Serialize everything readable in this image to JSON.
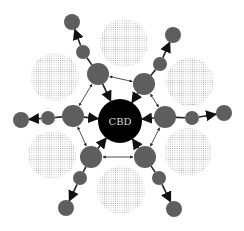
{
  "diagram": {
    "center": {
      "label": "CBD",
      "x": 120,
      "y": 121,
      "r": 22,
      "fill": "#000000",
      "text_color": "#d8d8d8"
    },
    "colors": {
      "node": "#5e5e5e",
      "edge": "#222222",
      "dots": "#b0b0b0"
    },
    "zones": [
      {
        "x": 124,
        "y": 43,
        "r": 24
      },
      {
        "x": 55,
        "y": 77,
        "r": 24
      },
      {
        "x": 190,
        "y": 82,
        "r": 24
      },
      {
        "x": 52,
        "y": 155,
        "r": 24
      },
      {
        "x": 188,
        "y": 152,
        "r": 24
      },
      {
        "x": 121,
        "y": 190,
        "r": 24
      }
    ],
    "inner_nodes": [
      {
        "id": "tl",
        "x": 98,
        "y": 74,
        "r": 11
      },
      {
        "id": "tr",
        "x": 144,
        "y": 84,
        "r": 11
      },
      {
        "id": "l",
        "x": 73,
        "y": 116,
        "r": 11
      },
      {
        "id": "r",
        "x": 165,
        "y": 117,
        "r": 11
      },
      {
        "id": "bl",
        "x": 91,
        "y": 157,
        "r": 11
      },
      {
        "id": "br",
        "x": 145,
        "y": 157,
        "r": 11
      }
    ],
    "mid_nodes": [
      {
        "id": "tl",
        "x": 83,
        "y": 52,
        "r": 7
      },
      {
        "id": "tr",
        "x": 160,
        "y": 64,
        "r": 7
      },
      {
        "id": "l",
        "x": 48,
        "y": 118,
        "r": 7
      },
      {
        "id": "r",
        "x": 192,
        "y": 118,
        "r": 7
      },
      {
        "id": "bl",
        "x": 80,
        "y": 178,
        "r": 7
      },
      {
        "id": "br",
        "x": 159,
        "y": 178,
        "r": 7
      }
    ],
    "outer_nodes": [
      {
        "id": "tl",
        "x": 72,
        "y": 22,
        "r": 8
      },
      {
        "id": "tr",
        "x": 173,
        "y": 35,
        "r": 8
      },
      {
        "id": "l",
        "x": 21,
        "y": 120,
        "r": 8
      },
      {
        "id": "r",
        "x": 224,
        "y": 113,
        "r": 8
      },
      {
        "id": "bl",
        "x": 66,
        "y": 208,
        "r": 8
      },
      {
        "id": "br",
        "x": 174,
        "y": 209,
        "r": 8
      }
    ]
  }
}
